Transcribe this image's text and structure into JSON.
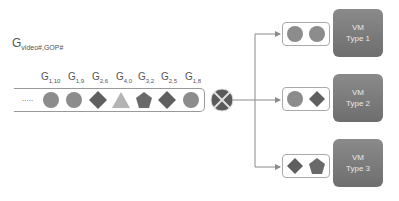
{
  "title": {
    "base": "G",
    "sub": "video#,GOP#"
  },
  "queue": {
    "ellipsis": ".....",
    "items": [
      {
        "label_sub": "1,10",
        "shape": "circle"
      },
      {
        "label_sub": "1,9",
        "shape": "circle"
      },
      {
        "label_sub": "2,6",
        "shape": "diamond"
      },
      {
        "label_sub": "4,0",
        "shape": "triangle"
      },
      {
        "label_sub": "3,2",
        "shape": "pentagon"
      },
      {
        "label_sub": "2,5",
        "shape": "diamond"
      },
      {
        "label_sub": "1,8",
        "shape": "circle"
      }
    ]
  },
  "dispatcher": {
    "icon": "x-circle-icon"
  },
  "vms": [
    {
      "line1": "VM",
      "line2": "Type 1",
      "queue": [
        "circle",
        "circle"
      ]
    },
    {
      "line1": "VM",
      "line2": "Type 2",
      "queue": [
        "circle",
        "diamond"
      ]
    },
    {
      "line1": "VM",
      "line2": "Type 3",
      "queue": [
        "diamond",
        "pentagon"
      ]
    }
  ],
  "colors": {
    "circle": "#8c8c8c",
    "diamond": "#5f5f5f",
    "triangle": "#b4b4b4",
    "pentagon": "#6a6a6a",
    "vm_box": "#7a7a7a",
    "lines": "#8a8a8a"
  }
}
